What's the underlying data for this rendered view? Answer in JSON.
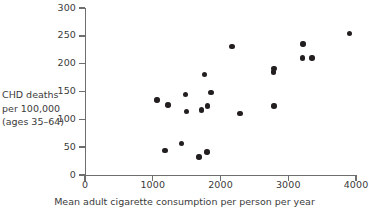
{
  "chart_data": {
    "type": "scatter",
    "title": "",
    "xlabel": "Mean adult cigarette consumption per person per year",
    "ylabel": "CHD deaths per 100,000 (ages 35–64)",
    "ylabel_lines": [
      "CHD deaths",
      "per 100,000",
      "(ages 35–64)"
    ],
    "xlim": [
      0,
      4000
    ],
    "ylim": [
      0,
      300
    ],
    "xticks": [
      0,
      1000,
      2000,
      3000,
      4000
    ],
    "yticks": [
      0,
      50,
      100,
      150,
      200,
      250,
      300
    ],
    "xticklabels": [
      "0",
      "1000",
      "2000",
      "3000",
      "4000"
    ],
    "yticklabels": [
      "0",
      "50",
      "100",
      "150",
      "200",
      "250",
      "300"
    ],
    "grid": false,
    "legend": false,
    "marker": "filled-circle",
    "marker_color": "#231f20",
    "axis_color": "#6e6e6e",
    "points": [
      {
        "x": 1065,
        "y": 135
      },
      {
        "x": 1225,
        "y": 126
      },
      {
        "x": 1180,
        "y": 44
      },
      {
        "x": 1420,
        "y": 57
      },
      {
        "x": 1480,
        "y": 145
      },
      {
        "x": 1495,
        "y": 114
      },
      {
        "x": 1680,
        "y": 32
      },
      {
        "x": 1720,
        "y": 117
      },
      {
        "x": 1800,
        "y": 41
      },
      {
        "x": 1810,
        "y": 124
      },
      {
        "x": 1760,
        "y": 181
      },
      {
        "x": 1860,
        "y": 148
      },
      {
        "x": 2170,
        "y": 231
      },
      {
        "x": 2290,
        "y": 111
      },
      {
        "x": 2790,
        "y": 191
      },
      {
        "x": 2780,
        "y": 185
      },
      {
        "x": 2790,
        "y": 124
      },
      {
        "x": 3220,
        "y": 235
      },
      {
        "x": 3210,
        "y": 210
      },
      {
        "x": 3350,
        "y": 210
      },
      {
        "x": 3900,
        "y": 254
      }
    ]
  }
}
